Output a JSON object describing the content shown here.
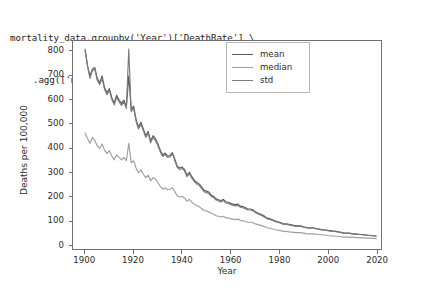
{
  "code": {
    "line1": "mortality_data.groupby('Year')['DeathRate'] \\",
    "line2": ".agg(['mean','median','std']).plot(ylabel='Deaths per 100,000')"
  },
  "chart_data": {
    "type": "line",
    "title": "",
    "xlabel": "Year",
    "ylabel": "Deaths per 100,000",
    "xlim": [
      1895,
      2022
    ],
    "ylim": [
      -18,
      845
    ],
    "grid": false,
    "legend_position": "upper right",
    "xticks": [
      1900,
      1920,
      1940,
      1960,
      1980,
      2000,
      2020
    ],
    "yticks": [
      0,
      100,
      200,
      300,
      400,
      500,
      600,
      700,
      800
    ],
    "colors": {
      "mean": "#5b5b5b",
      "median": "#9e9e9e",
      "std": "#7c7c7c"
    },
    "x": [
      1900,
      1901,
      1902,
      1903,
      1904,
      1905,
      1906,
      1907,
      1908,
      1909,
      1910,
      1911,
      1912,
      1913,
      1914,
      1915,
      1916,
      1917,
      1918,
      1919,
      1920,
      1921,
      1922,
      1923,
      1924,
      1925,
      1926,
      1927,
      1928,
      1929,
      1930,
      1931,
      1932,
      1933,
      1934,
      1935,
      1936,
      1937,
      1938,
      1939,
      1940,
      1941,
      1942,
      1943,
      1944,
      1945,
      1946,
      1947,
      1948,
      1949,
      1950,
      1951,
      1952,
      1953,
      1954,
      1955,
      1956,
      1957,
      1958,
      1959,
      1960,
      1961,
      1962,
      1963,
      1964,
      1965,
      1966,
      1967,
      1968,
      1969,
      1970,
      1971,
      1972,
      1973,
      1974,
      1975,
      1976,
      1977,
      1978,
      1979,
      1980,
      1981,
      1982,
      1983,
      1984,
      1985,
      1986,
      1987,
      1988,
      1989,
      1990,
      1991,
      1992,
      1993,
      1994,
      1995,
      1996,
      1997,
      1998,
      1999,
      2000,
      2001,
      2002,
      2003,
      2004,
      2005,
      2006,
      2007,
      2008,
      2009,
      2010,
      2011,
      2012,
      2013,
      2014,
      2015,
      2016,
      2017,
      2018,
      2019,
      2020
    ],
    "series": [
      {
        "name": "mean",
        "values": [
          810,
          742,
          700,
          728,
          735,
          690,
          672,
          700,
          652,
          630,
          648,
          610,
          588,
          620,
          600,
          586,
          600,
          572,
          700,
          560,
          575,
          520,
          488,
          508,
          480,
          452,
          470,
          430,
          452,
          440,
          418,
          392,
          372,
          380,
          368,
          370,
          382,
          355,
          325,
          318,
          322,
          312,
          288,
          300,
          282,
          268,
          258,
          252,
          240,
          226,
          222,
          218,
          206,
          200,
          190,
          186,
          182,
          188,
          178,
          176,
          172,
          168,
          166,
          168,
          160,
          158,
          154,
          148,
          148,
          146,
          138,
          132,
          128,
          124,
          118,
          110,
          108,
          104,
          100,
          96,
          94,
          90,
          86,
          86,
          84,
          82,
          80,
          78,
          78,
          78,
          74,
          72,
          70,
          70,
          70,
          68,
          66,
          64,
          62,
          62,
          60,
          58,
          56,
          56,
          54,
          52,
          50,
          48,
          48,
          48,
          46,
          45,
          44,
          43,
          42,
          41,
          40,
          39,
          38,
          37,
          36
        ]
      },
      {
        "name": "median",
        "values": [
          462,
          440,
          420,
          445,
          432,
          410,
          400,
          418,
          392,
          378,
          390,
          368,
          352,
          372,
          362,
          352,
          362,
          348,
          420,
          340,
          348,
          318,
          298,
          310,
          292,
          278,
          288,
          265,
          278,
          272,
          258,
          242,
          230,
          236,
          228,
          230,
          236,
          220,
          202,
          198,
          200,
          194,
          180,
          188,
          176,
          168,
          162,
          158,
          150,
          142,
          140,
          136,
          130,
          126,
          120,
          118,
          115,
          118,
          112,
          110,
          108,
          106,
          104,
          106,
          100,
          100,
          96,
          93,
          93,
          92,
          87,
          84,
          81,
          78,
          75,
          70,
          68,
          66,
          63,
          61,
          59,
          57,
          55,
          55,
          53,
          52,
          51,
          50,
          50,
          50,
          48,
          46,
          45,
          45,
          45,
          44,
          42,
          41,
          40,
          40,
          38,
          37,
          36,
          36,
          35,
          34,
          32,
          31,
          31,
          31,
          30,
          30,
          29,
          29,
          28,
          28,
          27,
          27,
          26,
          26,
          25
        ]
      },
      {
        "name": "std",
        "values": [
          805,
          740,
          690,
          722,
          728,
          682,
          664,
          690,
          645,
          622,
          640,
          602,
          580,
          612,
          592,
          578,
          592,
          565,
          812,
          552,
          566,
          512,
          480,
          500,
          472,
          445,
          462,
          422,
          445,
          432,
          410,
          385,
          366,
          374,
          362,
          364,
          376,
          348,
          320,
          312,
          316,
          306,
          282,
          294,
          276,
          262,
          252,
          246,
          234,
          220,
          216,
          212,
          200,
          195,
          185,
          181,
          177,
          183,
          173,
          171,
          167,
          163,
          161,
          163,
          155,
          153,
          149,
          144,
          144,
          142,
          134,
          128,
          124,
          120,
          114,
          107,
          105,
          101,
          97,
          93,
          91,
          87,
          84,
          84,
          82,
          80,
          78,
          76,
          76,
          76,
          72,
          70,
          68,
          68,
          68,
          66,
          64,
          62,
          60,
          60,
          58,
          56,
          55,
          55,
          53,
          51,
          49,
          47,
          47,
          47,
          45,
          44,
          43,
          42,
          41,
          40,
          39,
          38,
          37,
          36,
          35
        ]
      }
    ]
  },
  "legend": {
    "items": [
      {
        "label": "mean"
      },
      {
        "label": "median"
      },
      {
        "label": "std"
      }
    ]
  }
}
